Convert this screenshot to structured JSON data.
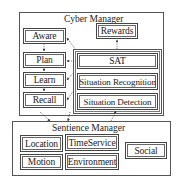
{
  "cyber_manager": {
    "title": "Cyber Manager",
    "left_column": [
      "Aware",
      "Plan",
      "Learn",
      "Recall"
    ],
    "rewards": "Rewards",
    "sat_group": [
      "SAT",
      "Situation Recognition",
      "Situation Detection"
    ]
  },
  "sentience_manager": {
    "title": "Sentience Manager",
    "modules": {
      "location": "Location",
      "motion": "Motion",
      "time_service": "TimeService",
      "environment": "Environment",
      "social": "Social"
    }
  },
  "colors": {
    "line": "#444444",
    "background": "#ffffff",
    "text": "#222222"
  }
}
